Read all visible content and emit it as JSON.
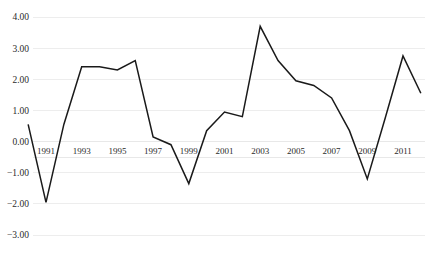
{
  "chart_data": {
    "type": "line",
    "title": "",
    "subtitle": "",
    "xlabel": "",
    "ylabel": "",
    "grid": true,
    "legend": null,
    "legend_position": "none",
    "line_color": "#1a1a1a",
    "gridline_color": "#e8e8e8",
    "background_color": "#ffffff",
    "xlim": [
      1990,
      2012
    ],
    "ylim": [
      -3.0,
      4.0
    ],
    "y_ticks": [
      4.0,
      3.0,
      2.0,
      1.0,
      0.0,
      -1.0,
      -2.0,
      -3.0
    ],
    "y_tick_labels": [
      "4.00",
      "3.00",
      "2.00",
      "1.00",
      "0.00",
      "-1.00",
      "-2.00",
      "-3.00"
    ],
    "x_ticks": [
      1991,
      1993,
      1995,
      1997,
      1999,
      2001,
      2003,
      2005,
      2007,
      2009,
      2011
    ],
    "x_tick_labels": [
      "1991",
      "1993",
      "1995",
      "1997",
      "1999",
      "2001",
      "2003",
      "2005",
      "2007",
      "2009",
      "2011"
    ],
    "x": [
      1990,
      1991,
      1992,
      1993,
      1994,
      1995,
      1996,
      1997,
      1998,
      1999,
      2000,
      2001,
      2002,
      2003,
      2004,
      2005,
      2006,
      2007,
      2008,
      2009,
      2010,
      2011,
      2012
    ],
    "values": [
      0.55,
      -1.95,
      0.55,
      2.4,
      2.4,
      2.3,
      2.6,
      0.15,
      -0.1,
      -1.35,
      0.35,
      0.95,
      0.8,
      3.7,
      2.6,
      1.95,
      1.8,
      1.4,
      0.35,
      -1.2,
      0.75,
      2.75,
      1.55
    ],
    "series": [
      {
        "name": "series-1",
        "color": "#1a1a1a",
        "values": [
          0.55,
          -1.95,
          0.55,
          2.4,
          2.4,
          2.3,
          2.6,
          0.15,
          -0.1,
          -1.35,
          0.35,
          0.95,
          0.8,
          3.7,
          2.6,
          1.95,
          1.8,
          1.4,
          0.35,
          -1.2,
          0.75,
          2.75,
          1.55
        ]
      }
    ]
  }
}
